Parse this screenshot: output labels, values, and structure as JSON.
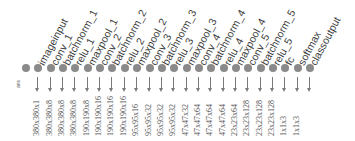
{
  "diagram": {
    "type": "layer-graph",
    "output_label": "ans",
    "colors": {
      "node": "#8a8a8a",
      "text": "#3a3a3a",
      "arrow": "#7a7a7a"
    },
    "layers": [
      {
        "name": "imageinput",
        "size": "380x380x1"
      },
      {
        "name": "conv_1",
        "size": "380x380x8"
      },
      {
        "name": "batchnorm_1",
        "size": "380x380x8"
      },
      {
        "name": "relu_1",
        "size": "380x380x8"
      },
      {
        "name": "maxpool_1",
        "size": "190x190x8"
      },
      {
        "name": "conv_2",
        "size": "190x190x16"
      },
      {
        "name": "batchnorm_2",
        "size": "190x190x16"
      },
      {
        "name": "relu_2",
        "size": "190x190x16"
      },
      {
        "name": "maxpool_2",
        "size": "95x95x16"
      },
      {
        "name": "conv_3",
        "size": "95x95x32"
      },
      {
        "name": "batchnorm_3",
        "size": "95x95x32"
      },
      {
        "name": "relu_3",
        "size": "95x95x32"
      },
      {
        "name": "maxpool_3",
        "size": "47x47x32"
      },
      {
        "name": "conv_4",
        "size": "47x47x64"
      },
      {
        "name": "batchnorm_4",
        "size": "47x47x64"
      },
      {
        "name": "relu_4",
        "size": "47x47x64"
      },
      {
        "name": "maxpool_4",
        "size": "23x23x64"
      },
      {
        "name": "conv_5",
        "size": "23x23x128"
      },
      {
        "name": "batchnorm_5",
        "size": "23x23x128"
      },
      {
        "name": "relu_5",
        "size": "23x23x128"
      },
      {
        "name": "fc",
        "size": "1x1x3"
      },
      {
        "name": "softmax",
        "size": "1x1x3"
      },
      {
        "name": "classoutput",
        "size": ""
      }
    ]
  }
}
